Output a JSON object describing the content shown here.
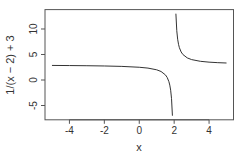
{
  "chart_data": {
    "type": "line",
    "title": "",
    "xlabel": "x",
    "ylabel": "1/(x − 2) + 3",
    "xlim": [
      -5.4,
      5.4
    ],
    "ylim": [
      -7.8,
      13.8
    ],
    "x_ticks": [
      -4,
      -2,
      0,
      2,
      4
    ],
    "x_tick_labels": [
      "-4",
      "-2",
      "0",
      "2",
      "4"
    ],
    "y_ticks": [
      -5,
      0,
      5,
      10
    ],
    "y_tick_labels": [
      "-5",
      "0",
      "5",
      "10"
    ],
    "grid": false,
    "legend": null,
    "function": "1/(x - 2) + 3",
    "series": [
      {
        "name": "left branch",
        "x": [
          -5,
          -4,
          -3,
          -2,
          -1,
          0,
          0.5,
          1,
          1.25,
          1.5,
          1.6,
          1.7,
          1.75,
          1.8,
          1.85,
          1.9
        ],
        "y": [
          2.857,
          2.833,
          2.8,
          2.75,
          2.667,
          2.5,
          2.333,
          2.0,
          1.667,
          1.0,
          0.5,
          -0.333,
          -1.0,
          -2.0,
          -3.667,
          -7.0
        ]
      },
      {
        "name": "right branch",
        "x": [
          2.1,
          2.15,
          2.2,
          2.25,
          2.3,
          2.4,
          2.5,
          2.75,
          3,
          3.5,
          4,
          4.5,
          5
        ],
        "y": [
          13.0,
          9.667,
          8.0,
          7.0,
          6.333,
          5.5,
          5.0,
          4.333,
          4.0,
          3.667,
          3.5,
          3.4,
          3.333
        ]
      }
    ]
  },
  "colors": {
    "line": "#333333",
    "axis": "#555555",
    "text": "#333333",
    "background": "#ffffff"
  }
}
